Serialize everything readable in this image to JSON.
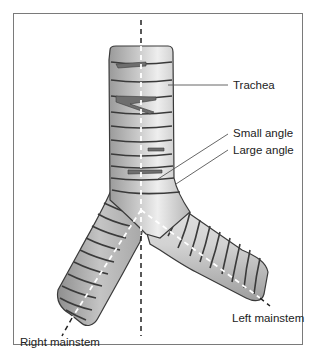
{
  "diagram": {
    "labels": {
      "trachea": "Trachea",
      "small_angle": "Small angle",
      "large_angle": "Large angle",
      "left_mainstem": "Left mainstem",
      "right_mainstem": "Right mainstem"
    },
    "colors": {
      "frame": "#7a7a7a",
      "cartilage_fill": "#c8c8c8",
      "cartilage_light": "#e6e6e6",
      "ring_line": "#3a3a3a",
      "dashed_axis": "#222222",
      "leader_line": "#555555"
    }
  }
}
